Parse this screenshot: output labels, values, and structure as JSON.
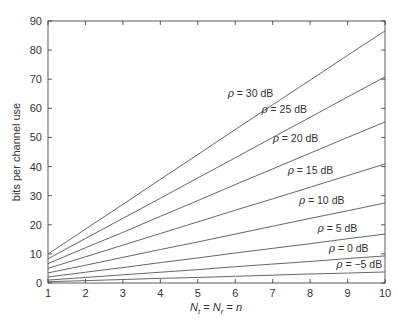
{
  "chart_data": {
    "type": "line",
    "title": "",
    "xlabel": "N_t = N_r = n",
    "ylabel": "bits per channel use",
    "xlim": [
      1,
      10
    ],
    "ylim": [
      0,
      90
    ],
    "xticks": [
      1,
      2,
      3,
      4,
      5,
      6,
      7,
      8,
      9,
      10
    ],
    "yticks": [
      0,
      10,
      20,
      30,
      40,
      50,
      60,
      70,
      80,
      90
    ],
    "grid": false,
    "legend": "inline labels",
    "x": [
      1,
      2,
      3,
      4,
      5,
      6,
      7,
      8,
      9,
      10
    ],
    "series": [
      {
        "name": "ρ = 30 dB",
        "label_pos": [
          5.8,
          64
        ],
        "values": [
          9.97,
          18.5,
          27.0,
          35.6,
          44.1,
          52.7,
          61.2,
          69.7,
          78.2,
          86.6
        ]
      },
      {
        "name": "ρ = 25 dB",
        "label_pos": [
          6.7,
          58.5
        ],
        "values": [
          8.3,
          15.3,
          22.2,
          29.1,
          36.1,
          43.0,
          50.0,
          56.9,
          63.9,
          70.8
        ]
      },
      {
        "name": "ρ = 20 dB",
        "label_pos": [
          7.0,
          48.5
        ],
        "values": [
          6.66,
          12.1,
          17.4,
          22.9,
          28.3,
          33.8,
          39.2,
          44.6,
          50.0,
          55.3
        ]
      },
      {
        "name": "ρ = 15 dB",
        "label_pos": [
          7.4,
          37.5
        ],
        "values": [
          5.03,
          9.0,
          13.0,
          17.0,
          21.0,
          25.0,
          28.9,
          32.9,
          36.9,
          40.9
        ]
      },
      {
        "name": "ρ = 10 dB",
        "label_pos": [
          7.7,
          27.3
        ],
        "values": [
          3.46,
          6.1,
          8.8,
          11.5,
          14.1,
          16.8,
          19.5,
          22.2,
          24.8,
          27.5
        ]
      },
      {
        "name": "ρ = 5 dB",
        "label_pos": [
          8.2,
          17.5
        ],
        "values": [
          2.06,
          3.7,
          5.3,
          7.0,
          8.6,
          10.3,
          11.9,
          13.5,
          15.2,
          16.8
        ]
      },
      {
        "name": "ρ = 0 dB",
        "label_pos": [
          8.5,
          10.5
        ],
        "values": [
          1.0,
          1.9,
          2.8,
          3.7,
          4.6,
          5.6,
          6.5,
          7.4,
          8.4,
          9.3
        ]
      },
      {
        "name": "ρ = −5 dB",
        "label_pos": [
          8.7,
          5.2
        ],
        "values": [
          0.45,
          0.8,
          1.2,
          1.6,
          1.9,
          2.3,
          2.7,
          3.1,
          3.4,
          3.8
        ]
      }
    ]
  },
  "axes": {
    "ylabel": "bits per channel use",
    "xlabel_parts": [
      "N",
      "t",
      " = ",
      "N",
      "r",
      " = ",
      "n"
    ]
  },
  "colors": {
    "line": "#555555",
    "axis": "#333333",
    "background": "#ffffff"
  }
}
